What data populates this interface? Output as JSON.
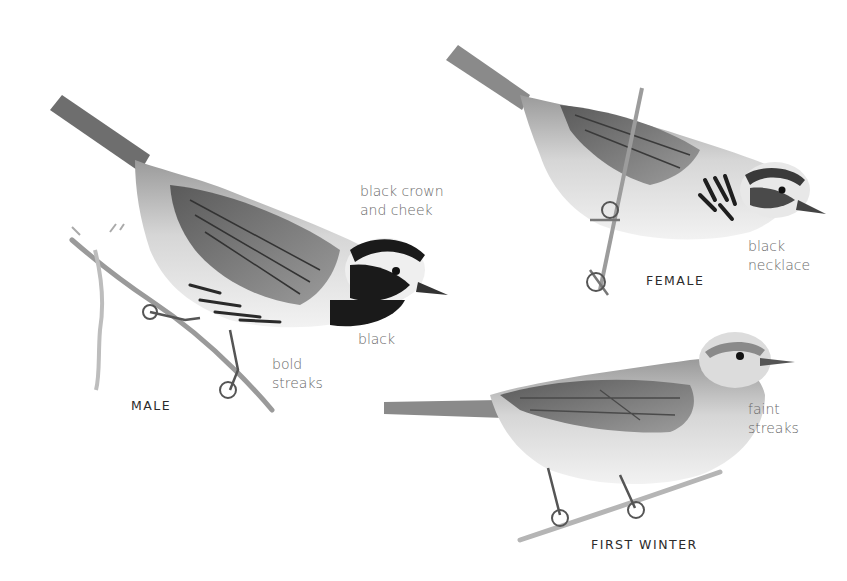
{
  "figure": {
    "subjects": [
      {
        "id": "male",
        "caption": "MALE",
        "annotations": [
          {
            "id": "crown",
            "text": "black crown\nand cheek"
          },
          {
            "id": "throat",
            "text": "black"
          },
          {
            "id": "streaks",
            "text": "bold\nstreaks"
          }
        ]
      },
      {
        "id": "female",
        "caption": "FEMALE",
        "annotations": [
          {
            "id": "necklace",
            "text": "black\nnecklace"
          }
        ]
      },
      {
        "id": "first_winter",
        "caption": "FIRST WINTER",
        "annotations": [
          {
            "id": "faint",
            "text": "faint\nstreaks"
          }
        ]
      }
    ],
    "colors": {
      "background": "#ffffff",
      "annotation_text": "#6a6a6a",
      "caption_text": "#2b2b2b",
      "ink_dark": "#1a1a1a",
      "ink_mid": "#7a7a7a",
      "ink_light": "#c8c8c8"
    }
  }
}
